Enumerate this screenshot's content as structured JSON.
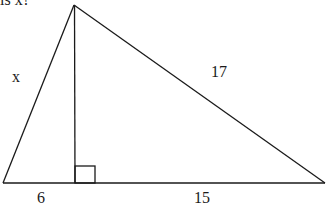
{
  "question": {
    "text": "is x?"
  },
  "diagram": {
    "type": "right-triangle-with-altitude",
    "stroke_color": "#1a1a1a",
    "background": "#ffffff",
    "vertices": {
      "apex": [
        74,
        5
      ],
      "base_left": [
        3,
        183
      ],
      "foot": [
        75,
        183
      ],
      "base_right": [
        325,
        183
      ]
    },
    "right_angle_marker": {
      "x": 75,
      "y": 166,
      "size": 20
    },
    "labels": {
      "left_side": "x",
      "hypotenuse": "17",
      "left_base_segment": "6",
      "right_base_segment": "15"
    }
  }
}
